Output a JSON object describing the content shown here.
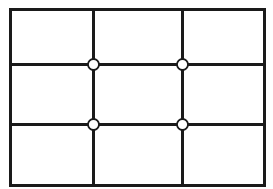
{
  "diagram": {
    "rows": 3,
    "columns": 3,
    "line_color": "#1a1a1a",
    "node_fill": "#ffffff",
    "intersections": 4
  }
}
